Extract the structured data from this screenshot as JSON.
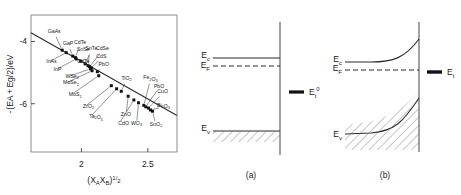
{
  "figure": {
    "panels": [
      {
        "id": "scatter",
        "caption": ""
      },
      {
        "id": "band-flat",
        "caption": "(a)"
      },
      {
        "id": "band-bent",
        "caption": "(b)"
      }
    ]
  },
  "chart_data": {
    "type": "scatter",
    "title": "",
    "xlabel": "(X_A X_B)^1/2",
    "ylabel": "-(EA + Eg/2)/eV",
    "xlabel_parts": {
      "open": "(X",
      "subA": "A",
      "midX": "X",
      "subB": "B",
      "close": ")",
      "exp": "1",
      "slash": "/",
      "exp2": "2"
    },
    "ylabel_parts": {
      "minus": "-",
      "open": "(EA",
      "plus": "+",
      "eg": "Eg",
      "half": "/2)",
      "unit": "/eV"
    },
    "xlim": [
      1.62,
      2.72
    ],
    "ylim": [
      -7.55,
      -3.15
    ],
    "xticks": [
      2,
      2.5
    ],
    "xtick_labels": [
      "2",
      "2.5"
    ],
    "yticks": [
      -4,
      -6
    ],
    "ytick_labels": [
      "-4",
      "-6"
    ],
    "grid": false,
    "legend": null,
    "fit_line": {
      "x1": 1.62,
      "y1": -3.72,
      "x2": 2.72,
      "y2": -6.38,
      "label": ""
    },
    "points": [
      {
        "label": "GaAs",
        "x": 1.855,
        "y": -4.28,
        "lx": 1.795,
        "ly": -3.72,
        "anchor": "middle"
      },
      {
        "label": "InAs",
        "x": 1.885,
        "y": -4.36,
        "lx": 1.735,
        "ly": -4.7,
        "anchor": "start"
      },
      {
        "label": "GaP",
        "x": 1.935,
        "y": -4.47,
        "lx": 1.9,
        "ly": -4.1,
        "anchor": "middle"
      },
      {
        "label": "CdTe",
        "x": 1.955,
        "y": -4.52,
        "lx": 1.99,
        "ly": -4.09,
        "anchor": "middle"
      },
      {
        "label": "InP",
        "x": 1.96,
        "y": -4.56,
        "lx": 1.79,
        "ly": -4.95,
        "anchor": "start"
      },
      {
        "label": "CdTe",
        "x": 1.995,
        "y": -4.63,
        "lx": 1.968,
        "ly": -4.69,
        "anchor": "start"
      },
      {
        "label": "SnTe",
        "x": 2.028,
        "y": -4.72,
        "lx": 2.075,
        "ly": -4.28,
        "anchor": "middle"
      },
      {
        "label": "SnSe",
        "x": 2.05,
        "y": -4.78,
        "lx": 2.062,
        "ly": -4.3,
        "anchor": "end"
      },
      {
        "label": "CdSe",
        "x": 2.062,
        "y": -4.81,
        "lx": 2.158,
        "ly": -4.28,
        "anchor": "middle"
      },
      {
        "label": "CdS",
        "x": 2.075,
        "y": -4.85,
        "lx": 2.15,
        "ly": -4.53,
        "anchor": "middle"
      },
      {
        "label": "PbO",
        "x": 2.12,
        "y": -4.97,
        "lx": 2.168,
        "ly": -4.8,
        "anchor": "middle"
      },
      {
        "label": "WSe2",
        "x": 2.068,
        "y": -4.88,
        "lx": 1.88,
        "ly": -5.16,
        "anchor": "start"
      },
      {
        "label": "MoSe2",
        "x": 2.08,
        "y": -4.94,
        "lx": 1.862,
        "ly": -5.38,
        "anchor": "start"
      },
      {
        "label": "MoS2",
        "x": 2.13,
        "y": -5.1,
        "lx": 1.905,
        "ly": -5.76,
        "anchor": "start"
      },
      {
        "label": "ZrO2",
        "x": 2.225,
        "y": -5.42,
        "lx": 2.012,
        "ly": -6.14,
        "anchor": "start"
      },
      {
        "label": "Ta2O5",
        "x": 2.265,
        "y": -5.52,
        "lx": 2.058,
        "ly": -6.46,
        "anchor": "start"
      },
      {
        "label": "TiO2",
        "x": 2.3,
        "y": -5.6,
        "lx": 2.34,
        "ly": -5.23,
        "anchor": "middle"
      },
      {
        "label": "ZnO",
        "x": 2.352,
        "y": -5.76,
        "lx": 2.335,
        "ly": -6.4,
        "anchor": "middle"
      },
      {
        "label": "CdO",
        "x": 2.395,
        "y": -5.88,
        "lx": 2.278,
        "ly": -6.68,
        "anchor": "start"
      },
      {
        "label": "WO3",
        "x": 2.43,
        "y": -5.97,
        "lx": 2.415,
        "ly": -6.68,
        "anchor": "middle"
      },
      {
        "label": "Fe2O3",
        "x": 2.47,
        "y": -6.05,
        "lx": 2.52,
        "ly": -5.22,
        "anchor": "middle"
      },
      {
        "label": "PbO",
        "x": 2.485,
        "y": -6.1,
        "lx": 2.585,
        "ly": -5.48,
        "anchor": "middle"
      },
      {
        "label": "CuO",
        "x": 2.505,
        "y": -6.14,
        "lx": 2.612,
        "ly": -5.66,
        "anchor": "middle"
      },
      {
        "label": "Bi2O3",
        "x": 2.52,
        "y": -6.2,
        "lx": 2.618,
        "ly": -6.1,
        "anchor": "middle"
      },
      {
        "label": "SnO2",
        "x": 2.535,
        "y": -6.24,
        "lx": 2.562,
        "ly": -6.7,
        "anchor": "middle"
      }
    ]
  },
  "band_flat": {
    "caption": "(a)",
    "labels": {
      "ec": "E",
      "ec_sub": "c",
      "ef": "E",
      "ef_sub": "F",
      "ev": "E",
      "ev_sub": "v",
      "et": "E",
      "et_sub": "t",
      "et_sup": "0"
    }
  },
  "band_bent": {
    "caption": "(b)",
    "labels": {
      "ec": "E",
      "ec_sub": "c",
      "ef": "E",
      "ef_sub": "F",
      "ev": "E",
      "ev_sub": "v",
      "et": "E",
      "et_sub": "t"
    }
  },
  "colors": {
    "ink": "#1a1a1a",
    "frame": "#8a8a8a",
    "line": "#2b2b2b",
    "marker": "#111111",
    "hatch": "#6e6e6e"
  }
}
